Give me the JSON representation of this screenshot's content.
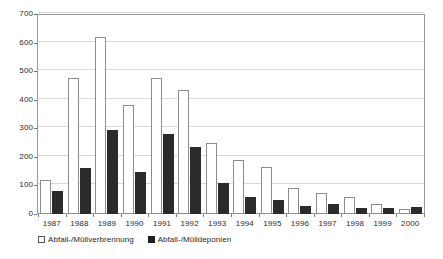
{
  "chart_data": {
    "type": "bar",
    "title": "",
    "subtitle": "",
    "xlabel": "",
    "ylabel": "",
    "ylim": [
      0,
      700
    ],
    "ytick_step": 100,
    "yticks": [
      0,
      100,
      200,
      300,
      400,
      500,
      600,
      700
    ],
    "grid": true,
    "legend_position": "bottom-left",
    "categories": [
      "1987",
      "1988",
      "1989",
      "1990",
      "1991",
      "1992",
      "1993",
      "1994",
      "1995",
      "1996",
      "1997",
      "1998",
      "1999",
      "2000"
    ],
    "series": [
      {
        "name": "Abfall-/Müllverbrennung",
        "style": "open",
        "color": "#ffffff",
        "border_color": "#8c8c8c",
        "values": [
          120,
          475,
          620,
          380,
          475,
          435,
          250,
          190,
          165,
          90,
          75,
          60,
          35,
          18
        ]
      },
      {
        "name": "Abfall-/Mülldeponien",
        "style": "filled",
        "color": "#2b2b2b",
        "border_color": "#2b2b2b",
        "values": [
          80,
          160,
          295,
          148,
          280,
          235,
          110,
          60,
          48,
          28,
          35,
          22,
          22,
          25
        ]
      }
    ]
  },
  "legend": {
    "items": [
      {
        "label": "Abfall-/Müllverbrennung",
        "style": "open"
      },
      {
        "label": "Abfall-/Mülldeponien",
        "style": "filled"
      }
    ]
  },
  "colors": {
    "series_open_fill": "#ffffff",
    "series_open_border": "#8c8c8c",
    "series_filled": "#2b2b2b",
    "grid": "#d9d9d9",
    "axis": "#9a9a9a",
    "text": "#2b2b2b",
    "background": "#ffffff"
  }
}
